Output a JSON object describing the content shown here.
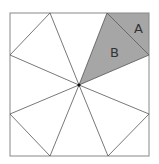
{
  "diagram": {
    "square": {
      "x": 10,
      "y": 13,
      "w": 139,
      "h": 143,
      "stroke": "#888888"
    },
    "center": {
      "x": 79,
      "y": 85
    },
    "edge_points": [
      {
        "x": 50,
        "y": 13
      },
      {
        "x": 107,
        "y": 13
      },
      {
        "x": 149,
        "y": 55
      },
      {
        "x": 149,
        "y": 114
      },
      {
        "x": 108,
        "y": 156
      },
      {
        "x": 50,
        "y": 156
      },
      {
        "x": 10,
        "y": 114
      },
      {
        "x": 10,
        "y": 55
      }
    ],
    "shaded_color": "#a6a6a6",
    "labels": {
      "A": "A",
      "B": "B"
    }
  }
}
